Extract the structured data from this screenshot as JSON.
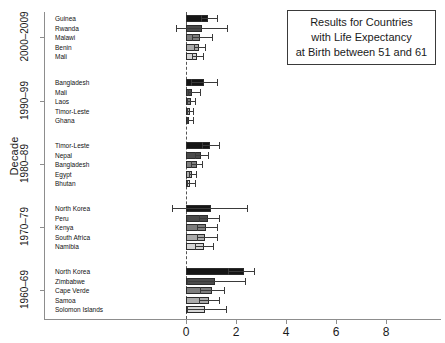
{
  "chart_data": {
    "type": "bar",
    "orientation": "horizontal",
    "title": "Results for Countries with Life Expectancy at Birth between 51 and 61",
    "xlabel": "",
    "ylabel": "Decade",
    "xlim": [
      -0.85,
      9.3
    ],
    "xticks": [
      0,
      2,
      4,
      6,
      8
    ],
    "xticklabels": [
      "0",
      "2",
      "4",
      "6",
      "8"
    ],
    "grid": false,
    "legend": false,
    "zero_reference_line": true,
    "groups": [
      {
        "decade": "2000–2009",
        "countries": [
          "Guinea",
          "Rwanda",
          "Malawi",
          "Benin",
          "Mali"
        ],
        "values": [
          0.88,
          0.64,
          0.54,
          0.5,
          0.44
        ],
        "err_low": [
          0.6,
          -0.4,
          0.22,
          0.3,
          0.24
        ],
        "err_high": [
          1.22,
          1.64,
          1.02,
          0.74,
          0.66
        ]
      },
      {
        "decade": "1990–99",
        "countries": [
          "Bangladesh",
          "Mali",
          "Laos",
          "Timor-Leste",
          "Ghana"
        ],
        "values": [
          0.7,
          0.22,
          0.18,
          0.14,
          0.1
        ],
        "err_low": [
          0.18,
          0.06,
          0.04,
          0.03,
          0.02
        ],
        "err_high": [
          1.24,
          0.56,
          0.34,
          0.28,
          0.26
        ]
      },
      {
        "decade": "1980–89",
        "countries": [
          "Timor-Leste",
          "Nepal",
          "Bangladesh",
          "Egypt",
          "Bhutan"
        ],
        "values": [
          0.96,
          0.6,
          0.42,
          0.22,
          0.16
        ],
        "err_low": [
          0.62,
          0.36,
          0.2,
          0.1,
          0.04
        ],
        "err_high": [
          1.3,
          0.86,
          0.62,
          0.4,
          0.34
        ]
      },
      {
        "decade": "1970–79",
        "countries": [
          "North Korea",
          "Peru",
          "Kenya",
          "South Africa",
          "Namibia"
        ],
        "values": [
          1.0,
          0.86,
          0.8,
          0.76,
          0.7
        ],
        "err_low": [
          -0.56,
          0.5,
          0.44,
          0.42,
          0.36
        ],
        "err_high": [
          2.44,
          1.3,
          1.24,
          1.22,
          1.06
        ]
      },
      {
        "decade": "1960–69",
        "countries": [
          "North Korea",
          "Zimbabwe",
          "Cape Verde",
          "Samoa",
          "Solomon Islands"
        ],
        "values": [
          2.3,
          1.16,
          1.02,
          0.92,
          0.76
        ],
        "err_low": [
          1.66,
          0.02,
          0.56,
          0.5,
          0.04
        ],
        "err_high": [
          2.7,
          2.34,
          1.5,
          1.3,
          1.6
        ]
      }
    ]
  },
  "titlebox": {
    "line1": "Results for Countries",
    "line2": "with Life Expectancy",
    "line3": "at Birth between 51 and 61"
  },
  "axes": {
    "ytitle": "Decade"
  }
}
